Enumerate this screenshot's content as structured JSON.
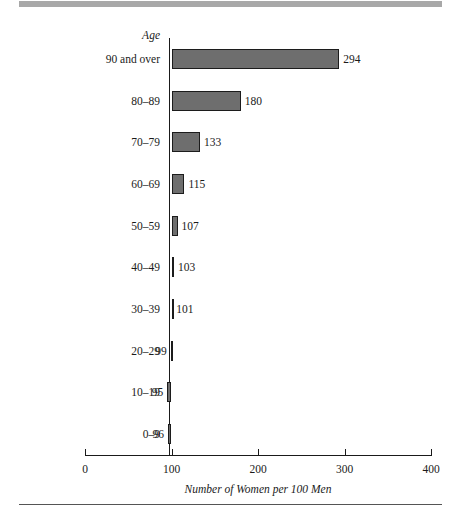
{
  "chart_data": {
    "type": "bar",
    "orientation": "horizontal",
    "title": "",
    "xlabel": "Number of Women per 100 Men",
    "ylabel": "Age",
    "categories": [
      "90 and over",
      "80–89",
      "70–79",
      "60–69",
      "50–59",
      "40–49",
      "30–39",
      "20–29",
      "10–19",
      "0–9"
    ],
    "values": [
      294,
      180,
      133,
      115,
      107,
      103,
      101,
      99,
      95,
      96
    ],
    "value_labels": [
      "294",
      "180",
      "133",
      "115",
      "107",
      "103",
      "101",
      "99",
      "95",
      "96"
    ],
    "xlim": [
      0,
      400
    ],
    "xticks": [
      0,
      100,
      200,
      300,
      400
    ],
    "xtick_labels": [
      "0",
      "100",
      "200",
      "300",
      "400"
    ],
    "baseline": 100,
    "grid": false,
    "legend": null,
    "bar_color": "#6e6e6e",
    "bar_edge_color": "#1c1c1c",
    "axis_color": "#1a1a1a"
  },
  "decor": {
    "top_rule_color": "#a8a8a8",
    "bottom_rule_color": "#555555"
  }
}
